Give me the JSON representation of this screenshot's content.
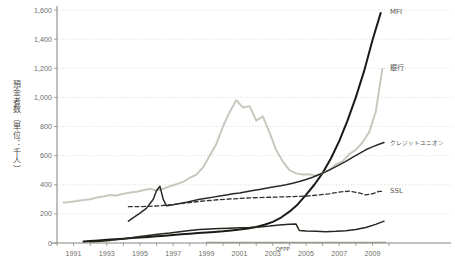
{
  "chart_data": {
    "type": "line",
    "title": "",
    "xlabel": "",
    "ylabel": "預金者数（単位：千人）",
    "xlim": [
      1990,
      2010
    ],
    "ylim": [
      0,
      1600
    ],
    "grid": true,
    "legend_position": "right-inline",
    "x_tick_labels": [
      "1991",
      "1993",
      "1995",
      "1997",
      "1999",
      "2001",
      "2003",
      "2005",
      "2007",
      "2009"
    ],
    "x_tick_values": [
      1991,
      1993,
      1995,
      1997,
      1999,
      2001,
      2003,
      2005,
      2007,
      2009
    ],
    "y_tick_labels": [
      "0",
      "200",
      "400",
      "600",
      "800",
      "1,000",
      "1,200",
      "1,400",
      "1,600"
    ],
    "y_tick_values": [
      0,
      200,
      400,
      600,
      800,
      1000,
      1200,
      1400,
      1600
    ],
    "series": [
      {
        "name": "MFI",
        "label": "MFI",
        "color": "#1a1a18",
        "style": "solid",
        "width": 2.0,
        "label_x": 2010.0,
        "label_y": 1590,
        "x": [
          1991.6,
          1992.0,
          1992.5,
          1993.0,
          1993.5,
          1994.0,
          1994.5,
          1995.0,
          1995.5,
          1996.0,
          1996.5,
          1997.0,
          1997.5,
          1998.0,
          1998.5,
          1999.0,
          1999.5,
          2000.0,
          2000.5,
          2001.0,
          2001.5,
          2002.0,
          2002.5,
          2003.0,
          2003.5,
          2004.0,
          2004.5,
          2005.0,
          2005.5,
          2006.0,
          2006.5,
          2007.0,
          2007.5,
          2008.0,
          2008.5,
          2009.0,
          2009.5
        ],
        "y": [
          10,
          14,
          18,
          22,
          26,
          30,
          34,
          38,
          42,
          46,
          50,
          55,
          60,
          64,
          68,
          72,
          76,
          80,
          86,
          92,
          100,
          110,
          125,
          145,
          175,
          215,
          265,
          330,
          400,
          480,
          580,
          700,
          840,
          1000,
          1180,
          1390,
          1580
        ]
      },
      {
        "name": "銀行",
        "label": "銀行",
        "color": "#c9c8bf",
        "style": "solid",
        "width": 2.0,
        "label_x": 2010.0,
        "label_y": 1200,
        "x": [
          1990.4,
          1990.8,
          1991.2,
          1991.6,
          1992.0,
          1992.4,
          1992.8,
          1993.2,
          1993.6,
          1994.0,
          1994.4,
          1994.8,
          1995.2,
          1995.6,
          1996.0,
          1996.4,
          1996.8,
          1997.2,
          1997.6,
          1998.0,
          1998.4,
          1998.8,
          1999.2,
          1999.6,
          2000.0,
          2000.4,
          2000.8,
          2001.2,
          2001.6,
          2002.0,
          2002.4,
          2002.8,
          2003.2,
          2003.6,
          2004.0,
          2004.4,
          2004.8,
          2005.2,
          2005.6,
          2006.0,
          2006.4,
          2006.8,
          2007.2,
          2007.6,
          2008.0,
          2008.4,
          2008.8,
          2009.2,
          2009.6
        ],
        "y": [
          278,
          282,
          288,
          296,
          300,
          312,
          320,
          330,
          326,
          338,
          346,
          352,
          362,
          372,
          360,
          372,
          390,
          404,
          420,
          448,
          470,
          520,
          600,
          680,
          800,
          900,
          980,
          930,
          940,
          840,
          870,
          760,
          640,
          560,
          500,
          478,
          470,
          472,
          462,
          480,
          500,
          540,
          560,
          610,
          640,
          690,
          760,
          900,
          1195
        ]
      },
      {
        "name": "クレジットユニオン",
        "label": "クレジットユニオン",
        "color": "#2a2a27",
        "style": "solid",
        "width": 1.5,
        "label_x": 2010.0,
        "label_y": 690,
        "x": [
          1994.3,
          1994.6,
          1995.0,
          1995.4,
          1995.8,
          1996.0,
          1996.2,
          1996.4,
          1996.6,
          1997.0,
          1997.4,
          1997.8,
          1998.2,
          1998.6,
          1999.0,
          1999.4,
          1999.8,
          2000.2,
          2000.6,
          2001.0,
          2001.4,
          2001.8,
          2002.2,
          2002.6,
          2003.0,
          2003.4,
          2003.8,
          2004.2,
          2004.6,
          2005.0,
          2005.4,
          2005.8,
          2006.2,
          2006.6,
          2007.0,
          2007.4,
          2007.8,
          2008.2,
          2008.6,
          2009.0,
          2009.4,
          2009.7
        ],
        "y": [
          150,
          175,
          205,
          240,
          300,
          360,
          390,
          300,
          255,
          262,
          272,
          280,
          290,
          300,
          308,
          315,
          322,
          330,
          338,
          344,
          352,
          360,
          368,
          376,
          384,
          392,
          400,
          410,
          422,
          436,
          452,
          470,
          490,
          512,
          536,
          560,
          588,
          614,
          640,
          660,
          678,
          690
        ]
      },
      {
        "name": "SSL",
        "label": "SSL",
        "color": "#30302c",
        "style": "dashed",
        "width": 1.3,
        "label_x": 2010.0,
        "label_y": 360,
        "x": [
          1994.3,
          1995.0,
          1995.6,
          1996.2,
          1996.8,
          1997.4,
          1998.0,
          1998.6,
          1999.2,
          1999.8,
          2000.4,
          2001.0,
          2001.6,
          2002.2,
          2002.8,
          2003.4,
          2004.0,
          2004.6,
          2005.2,
          2005.8,
          2006.4,
          2007.0,
          2007.6,
          2008.2,
          2008.6,
          2009.0,
          2009.4,
          2009.7
        ],
        "y": [
          250,
          250,
          252,
          256,
          262,
          270,
          278,
          286,
          292,
          298,
          302,
          306,
          310,
          312,
          314,
          316,
          318,
          320,
          324,
          330,
          338,
          350,
          356,
          344,
          330,
          338,
          354,
          356
        ]
      },
      {
        "name": "QFPP",
        "label": "QFPP",
        "color": "#9a9a92",
        "style": "solid",
        "width": 1.6,
        "label_x": 2003.6,
        "label_y": -42,
        "x": [
          1999.0,
          2000.0,
          2001.0,
          2002.0,
          2003.0,
          2004.0,
          2005.0,
          2006.0,
          2007.0,
          2008.0,
          2009.0,
          2009.8
        ],
        "y": [
          3,
          3,
          3,
          3,
          3,
          3,
          3,
          3,
          3,
          3,
          3,
          3
        ]
      },
      {
        "name": "unlabeled-lower-black",
        "label": "",
        "color": "#26261f",
        "style": "solid",
        "width": 1.5,
        "label_x": null,
        "label_y": null,
        "x": [
          1992.0,
          1992.6,
          1993.2,
          1993.8,
          1994.4,
          1995.0,
          1995.6,
          1996.2,
          1996.8,
          1997.4,
          1998.0,
          1998.6,
          1999.2,
          1999.8,
          2000.4,
          2001.0,
          2001.6,
          2002.2,
          2002.8,
          2003.4,
          2004.0,
          2004.4,
          2004.6,
          2005.0,
          2005.6,
          2006.2,
          2006.8,
          2007.4,
          2008.0,
          2008.6,
          2009.2,
          2009.7
        ],
        "y": [
          8,
          12,
          18,
          26,
          34,
          44,
          54,
          62,
          68,
          78,
          86,
          92,
          96,
          100,
          102,
          104,
          106,
          110,
          116,
          124,
          128,
          130,
          86,
          82,
          80,
          78,
          80,
          84,
          92,
          106,
          128,
          150
        ]
      }
    ]
  }
}
